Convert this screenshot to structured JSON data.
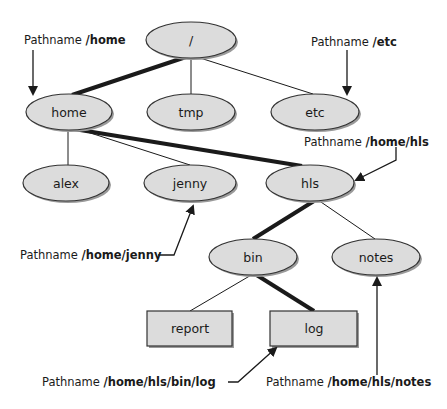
{
  "diagram": {
    "title": "",
    "colors": {
      "node_fill": "#dcdcdc",
      "node_stroke": "#333333",
      "edge": "#1a1a1a",
      "shadow": "#9a9a9a"
    },
    "nodes": [
      {
        "id": "root",
        "label": "/",
        "type": "directory",
        "cx": 191,
        "cy": 40
      },
      {
        "id": "home",
        "label": "home",
        "type": "directory",
        "cx": 69,
        "cy": 112
      },
      {
        "id": "tmp",
        "label": "tmp",
        "type": "directory",
        "cx": 191,
        "cy": 112
      },
      {
        "id": "etc",
        "label": "etc",
        "type": "directory",
        "cx": 315,
        "cy": 112
      },
      {
        "id": "alex",
        "label": "alex",
        "type": "directory",
        "cx": 66,
        "cy": 183
      },
      {
        "id": "jenny",
        "label": "jenny",
        "type": "directory",
        "cx": 190,
        "cy": 183
      },
      {
        "id": "hls",
        "label": "hls",
        "type": "directory",
        "cx": 310,
        "cy": 183
      },
      {
        "id": "bin",
        "label": "bin",
        "type": "directory",
        "cx": 253,
        "cy": 257
      },
      {
        "id": "notes",
        "label": "notes",
        "type": "file",
        "cx": 376,
        "cy": 257
      },
      {
        "id": "report",
        "label": "report",
        "type": "file",
        "cx": 190,
        "cy": 328
      },
      {
        "id": "log",
        "label": "log",
        "type": "file",
        "cx": 314,
        "cy": 328
      }
    ],
    "edges": [
      {
        "from": "root",
        "to": "home",
        "emphasis": "bold"
      },
      {
        "from": "root",
        "to": "tmp",
        "emphasis": "normal"
      },
      {
        "from": "root",
        "to": "etc",
        "emphasis": "normal"
      },
      {
        "from": "home",
        "to": "alex",
        "emphasis": "normal"
      },
      {
        "from": "home",
        "to": "jenny",
        "emphasis": "normal"
      },
      {
        "from": "home",
        "to": "hls",
        "emphasis": "bold"
      },
      {
        "from": "hls",
        "to": "bin",
        "emphasis": "bold"
      },
      {
        "from": "hls",
        "to": "notes",
        "emphasis": "normal"
      },
      {
        "from": "bin",
        "to": "report",
        "emphasis": "normal"
      },
      {
        "from": "bin",
        "to": "log",
        "emphasis": "bold"
      }
    ],
    "callouts": [
      {
        "id": "home",
        "prefix": "Pathname ",
        "path": "/home",
        "points_to": "home"
      },
      {
        "id": "etc",
        "prefix": "Pathname ",
        "path": "/etc",
        "points_to": "etc"
      },
      {
        "id": "hls",
        "prefix": "Pathname ",
        "path": "/home/hls",
        "points_to": "hls"
      },
      {
        "id": "jenny",
        "prefix": "Pathname ",
        "path": "/home/jenny",
        "points_to": "jenny"
      },
      {
        "id": "log",
        "prefix": "Pathname ",
        "path": "/home/hls/bin/log",
        "points_to": "log"
      },
      {
        "id": "notes",
        "prefix": "Pathname ",
        "path": "/home/hls/notes",
        "points_to": "notes"
      }
    ]
  }
}
